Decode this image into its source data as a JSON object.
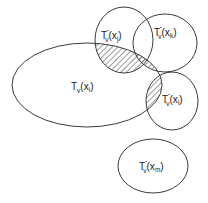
{
  "diagram": {
    "stroke_color": "#3a3a3a",
    "hatch_color": "#3a3a3a",
    "sets": [
      {
        "id": "tv-xi",
        "base": "T",
        "sub": "v",
        "sup": "",
        "arg_open": "(x",
        "arg_sub": "i",
        "arg_close": ")",
        "shape": "ellipse",
        "cx": 87,
        "cy": 85,
        "rx": 75,
        "ry": 42
      },
      {
        "id": "tv-xj",
        "base": "T",
        "sub": "v",
        "sup": "ˆ",
        "arg_open": "(x",
        "arg_sub": "j",
        "arg_close": ")",
        "shape": "ellipse",
        "cx": 124,
        "cy": 40,
        "rx": 29,
        "ry": 33
      },
      {
        "id": "tv-xk",
        "base": "T",
        "sub": "v",
        "sup": "ˆ",
        "arg_open": "(x",
        "arg_sub": "k",
        "arg_close": ")",
        "shape": "ellipse",
        "cx": 165,
        "cy": 43,
        "rx": 32,
        "ry": 29
      },
      {
        "id": "tv-xl",
        "base": "T",
        "sub": "v",
        "sup": "ˆ",
        "arg_open": "(x",
        "arg_sub": "l",
        "arg_close": ")",
        "shape": "ellipse",
        "cx": 172,
        "cy": 101,
        "rx": 26,
        "ry": 29
      },
      {
        "id": "tv-xm",
        "base": "T",
        "sub": "v",
        "sup": "ˆ",
        "arg_open": "(x",
        "arg_sub": "m",
        "arg_close": ")",
        "shape": "ellipse",
        "cx": 153,
        "cy": 166,
        "rx": 35,
        "ry": 27
      }
    ],
    "hatched_intersections": [
      "T_v(x_i) ∩ T_v^(x_j)",
      "T_v(x_i) ∩ T_v^(x_k)",
      "T_v(x_i) ∩ T_v^(x_l)"
    ]
  }
}
